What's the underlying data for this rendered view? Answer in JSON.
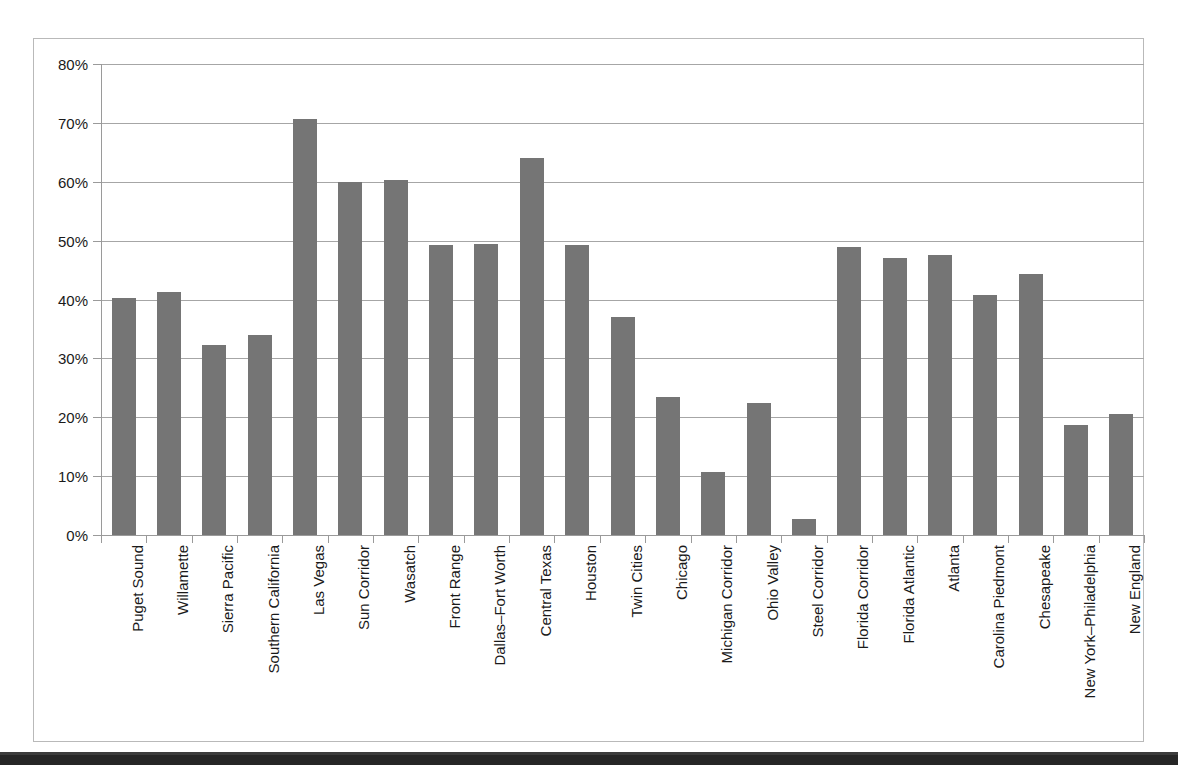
{
  "chart_data": {
    "type": "bar",
    "title": "",
    "xlabel": "",
    "ylabel": "",
    "ylim": [
      0,
      80
    ],
    "grid": true,
    "legend": null,
    "y_tick_labels": [
      "80%",
      "70%",
      "60%",
      "50%",
      "40%",
      "30%",
      "20%",
      "10%",
      "0%"
    ],
    "y_ticks": [
      80,
      70,
      60,
      50,
      40,
      30,
      20,
      10,
      0
    ],
    "units": "percent",
    "bar_color": "#757575",
    "categories": [
      "Puget Sound",
      "Willamette",
      "Sierra Pacific",
      "Southern California",
      "Las Vegas",
      "Sun Corridor",
      "Wasatch",
      "Front Range",
      "Dallas–Fort Worth",
      "Central Texas",
      "Houston",
      "Twin Cities",
      "Chicago",
      "Michigan Corridor",
      "Ohio Valley",
      "Steel Corridor",
      "Florida Corridor",
      "Florida Atlantic",
      "Atlanta",
      "Carolina Piedmont",
      "Chesapeake",
      "New York–Philadelphia",
      "New England"
    ],
    "values": [
      40.3,
      41.3,
      32.2,
      34.0,
      70.7,
      60.0,
      60.3,
      49.3,
      49.5,
      64.0,
      49.2,
      37.0,
      23.5,
      10.7,
      22.4,
      2.7,
      49.0,
      47.1,
      47.6,
      40.8,
      44.3,
      18.7,
      20.5
    ]
  },
  "colors": {
    "bar": "#757575",
    "gridline": "#a6a6a6",
    "axis": "#9a9a9a",
    "frame": "#b9b9b9",
    "text": "#1a1a1a",
    "scan_strip": "#262626"
  }
}
